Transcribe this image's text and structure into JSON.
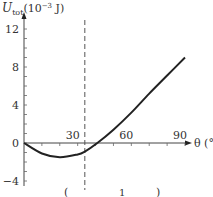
{
  "chart_data": {
    "type": "line",
    "title": "",
    "ylabel": "U_tot (10^-3 J)",
    "ylabel_main": "U",
    "ylabel_sub": "tot",
    "ylabel_unit": "(10",
    "ylabel_exp": "−3",
    "ylabel_unit_end": " J)",
    "xlabel": "θ (°)",
    "xlim": [
      0,
      90
    ],
    "ylim": [
      -4,
      12
    ],
    "x_ticks": [
      30,
      60,
      90
    ],
    "x_tick_labels": [
      "30",
      "60",
      "90"
    ],
    "y_ticks": [
      -4,
      0,
      4,
      8,
      12
    ],
    "y_tick_labels": [
      "−4",
      "0",
      "4",
      "8",
      "12"
    ],
    "grid": false,
    "legend": null,
    "vertical_dashed_line_x": 34,
    "series": [
      {
        "name": "U_tot",
        "x": [
          0,
          10,
          20,
          30,
          34,
          41,
          50,
          60,
          70,
          80,
          90
        ],
        "y": [
          0,
          -1.1,
          -1.5,
          -1.2,
          -0.9,
          0,
          1.4,
          3.2,
          5.2,
          7.1,
          9.0
        ]
      }
    ],
    "bottom_fragments": [
      "(",
      "1",
      ")"
    ]
  }
}
